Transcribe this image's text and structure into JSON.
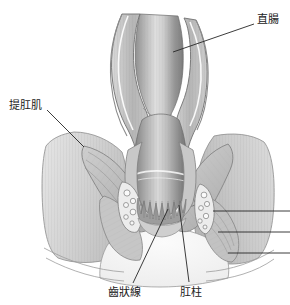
{
  "figure": {
    "background_color": "#ffffff",
    "width": 290,
    "height": 305,
    "style": "grayscale medical cross-section illustration",
    "leader_line_color": "#262626",
    "label_text_color": "#1a1a1a"
  },
  "labels": [
    {
      "id": "rectum",
      "text": "直腸",
      "x": 257,
      "y": 14,
      "leader": {
        "x1": 254,
        "y1": 24,
        "x2": 173,
        "y2": 52
      }
    },
    {
      "id": "levator-ani",
      "text": "提肛肌",
      "x": 9,
      "y": 100,
      "leader": {
        "x1": 47,
        "y1": 110,
        "x2": 84,
        "y2": 147
      }
    },
    {
      "id": "dentate-line",
      "text": "齒狀線",
      "x": 108,
      "y": 288,
      "leader": {
        "x1": 133,
        "y1": 285,
        "x2": 168,
        "y2": 209
      }
    },
    {
      "id": "anal-columns",
      "text": "肛柱",
      "x": 180,
      "y": 288,
      "leader": {
        "x1": 189,
        "y1": 284,
        "x2": 179,
        "y2": 205
      }
    }
  ],
  "unlabeled_leaders": [
    {
      "id": "right-leader-1",
      "x1": 290,
      "y1": 211,
      "x2": 213,
      "y2": 211
    },
    {
      "id": "right-leader-2",
      "x1": 290,
      "y1": 232,
      "x2": 218,
      "y2": 232
    },
    {
      "id": "right-leader-3",
      "x1": 290,
      "y1": 253,
      "x2": 228,
      "y2": 253
    }
  ],
  "anatomy_parts": [
    {
      "id": "rectal-lumen",
      "name": "rectal lumen",
      "fill": "gradient-gray"
    },
    {
      "id": "rectal-wall-left",
      "name": "left rectal wall",
      "fill": "#b9b9b9"
    },
    {
      "id": "rectal-wall-right",
      "name": "right rectal wall",
      "fill": "#b9b9b9"
    },
    {
      "id": "levator-ani-muscle",
      "name": "levator ani muscle sling",
      "fill": "#c9c9c9"
    },
    {
      "id": "external-sphincter",
      "name": "external anal sphincter",
      "fill": "#bdbdbd"
    },
    {
      "id": "internal-sphincter",
      "name": "internal anal sphincter",
      "fill": "#c4c4c4"
    },
    {
      "id": "dentate-line-zigzag",
      "name": "dentate line",
      "fill": "#8c8c8c"
    },
    {
      "id": "anal-columns-folds",
      "name": "anal columns",
      "fill": "#9a9a9a"
    },
    {
      "id": "hemorrhoidal-plexus-left",
      "name": "left hemorrhoidal vessels",
      "fill": "#e2e2e2"
    },
    {
      "id": "hemorrhoidal-plexus-right",
      "name": "right hemorrhoidal vessels",
      "fill": "#e2e2e2"
    },
    {
      "id": "perianal-skin",
      "name": "perianal skin",
      "fill": "#f2f2f2"
    },
    {
      "id": "buttock-tissue-left",
      "name": "left buttock tissue",
      "fill": "#d6d6d6"
    },
    {
      "id": "buttock-tissue-right",
      "name": "right buttock tissue",
      "fill": "#d6d6d6"
    }
  ]
}
